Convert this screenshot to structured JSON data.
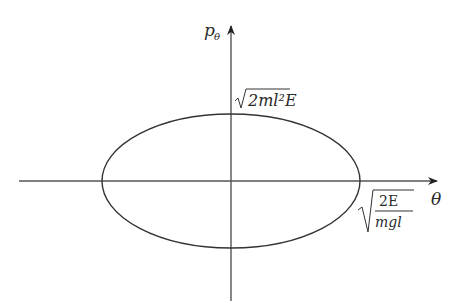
{
  "diagram": {
    "axes": {
      "x_label": "θ",
      "y_label": "p",
      "y_label_sub": "θ"
    },
    "annotations": {
      "p_max_radicand": "2ml²E",
      "theta_max_numerator": "2E",
      "theta_max_denominator": "mgl"
    },
    "colors": {
      "stroke": "#333333",
      "background": "#ffffff"
    }
  }
}
